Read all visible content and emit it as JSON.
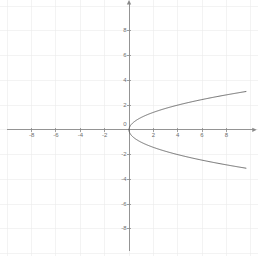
{
  "figure": {
    "width": 258,
    "height": 256,
    "background_color": "#ffffff"
  },
  "chart_data": {
    "type": "line",
    "title": "",
    "subtitle": "",
    "xlabel": "",
    "ylabel": "",
    "grid": true,
    "grid_spacing": 2,
    "grid_color": "#ebebeb",
    "legend": null,
    "legend_position": "none",
    "axis_color": "#8a8a8a",
    "curve_color": "#555555",
    "label_color": "#6e6e6e",
    "xlim": [
      -10.6,
      10.6
    ],
    "ylim": [
      -10.2,
      10.5
    ],
    "x_ticks": [
      -8,
      -6,
      -4,
      -2,
      2,
      4,
      6,
      8
    ],
    "x_tick_labels": [
      "-8",
      "-6",
      "-4",
      "-2",
      "2",
      "4",
      "6",
      "8"
    ],
    "y_ticks": [
      8,
      6,
      4,
      2,
      -2,
      -4,
      -6,
      -8
    ],
    "y_tick_labels": [
      "8",
      "6",
      "4",
      "2",
      "-2",
      "-4",
      "-6",
      "-8"
    ],
    "origin_label": "0",
    "series": [
      {
        "name": "x = y^2 (upper branch)",
        "equation": "y = sqrt(x)",
        "x": [
          0,
          0.0625,
          0.25,
          0.5625,
          1,
          1.5625,
          2.25,
          3.0625,
          4,
          5.0625,
          6.25,
          7.5625,
          9,
          9.61
        ],
        "values": [
          0,
          0.25,
          0.5,
          0.75,
          1,
          1.25,
          1.5,
          1.75,
          2,
          2.25,
          2.5,
          2.75,
          3,
          3.1
        ]
      },
      {
        "name": "x = y^2 (lower branch)",
        "equation": "y = -sqrt(x)",
        "x": [
          0,
          0.0625,
          0.25,
          0.5625,
          1,
          1.5625,
          2.25,
          3.0625,
          4,
          5.0625,
          6.25,
          7.5625,
          9,
          9.61
        ],
        "values": [
          0,
          -0.25,
          -0.5,
          -0.75,
          -1,
          -1.25,
          -1.5,
          -1.75,
          -2,
          -2.25,
          -2.5,
          -2.75,
          -3,
          -3.1
        ]
      }
    ],
    "annotations": [],
    "vertex": [
      0,
      0
    ],
    "opens": "right"
  }
}
